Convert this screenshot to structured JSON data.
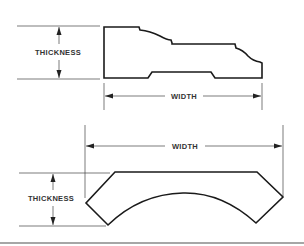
{
  "diagram": {
    "figure_top": {
      "thickness_label": "THICKNESS",
      "width_label": "WIDTH"
    },
    "figure_bottom": {
      "thickness_label": "THICKNESS",
      "width_label": "WIDTH"
    },
    "colors": {
      "line": "#1a1a1a",
      "dim_line": "#444444",
      "rule": "#888888"
    }
  }
}
